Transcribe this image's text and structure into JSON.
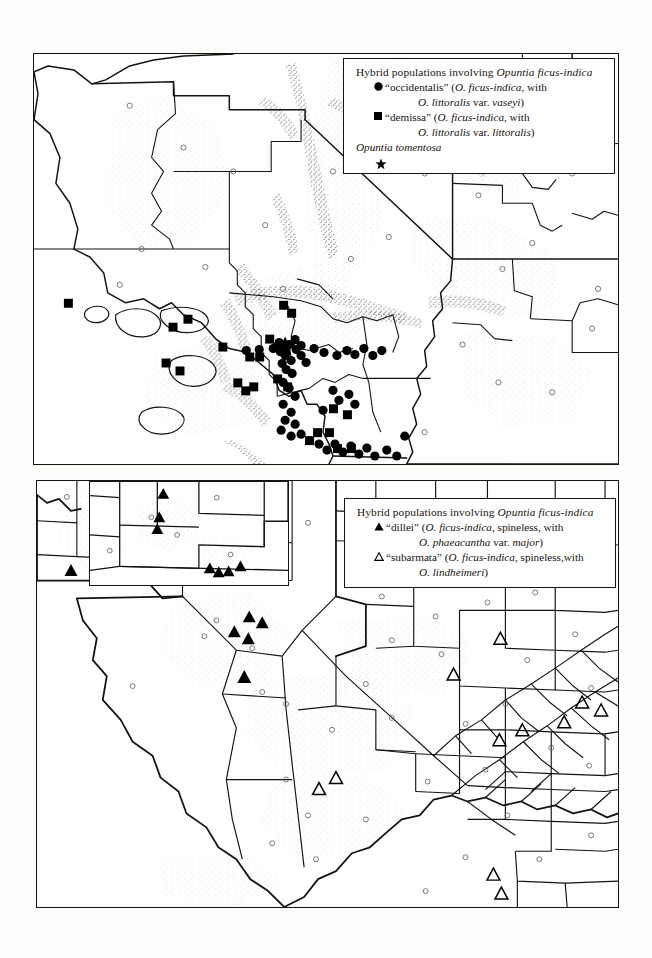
{
  "page": {
    "background_color": "#fdfdfc",
    "ink_color": "#15130f"
  },
  "figure": {
    "type": "distribution-maps",
    "panels": [
      {
        "id": "top",
        "region": "California, Nevada, Arizona, Utah",
        "legend_id": "legend-top"
      },
      {
        "id": "bottom",
        "region": "New Mexico and Texas",
        "legend_id": "legend-bottom",
        "inset_label": "New Mexico inset"
      }
    ]
  },
  "legend_top": {
    "title_plain": "Hybrid populations involving ",
    "title_italic": "Opuntia ficus-indica",
    "entries": [
      {
        "symbol": "filled-circle",
        "line1_pre": "“occiden­talis” (",
        "line1_label": "“occidentalis” (",
        "line1_italic": "O. ficus-indica",
        "line1_post": ", with",
        "line2_italic_a": "O. littoralis",
        "line2_mid": " var. ",
        "line2_italic_b": "vaseyi",
        "line2_post": ")"
      },
      {
        "symbol": "filled-square",
        "line1_label": "“demissa” (",
        "line1_italic": "O. ficus-indica",
        "line1_post": ", with",
        "line2_italic_a": "O. littoralis",
        "line2_mid": " var. ",
        "line2_italic_b": "littoralis",
        "line2_post": ")"
      }
    ],
    "tomentosa_label": "Opuntia tomentosa",
    "tomentosa_symbol": "filled-star"
  },
  "legend_bottom": {
    "title_plain": "Hybrid populations involving ",
    "title_italic": "Opuntia ficus-indica",
    "entries": [
      {
        "symbol": "filled-triangle",
        "line1_label": "“dillei” (",
        "line1_italic": "O. ficus-indica",
        "line1_post": ", spineless, with",
        "line2_italic_a": "O. phaeacantha",
        "line2_mid": " var. ",
        "line2_italic_b": "major",
        "line2_post": ")"
      },
      {
        "symbol": "open-triangle",
        "line1_label": "“subarmata” (",
        "line1_italic": "O. ficus-indica",
        "line1_post": ", spineless,with",
        "line2_italic_a": "O. lindheimeri",
        "line2_mid": "",
        "line2_italic_b": "",
        "line2_post": ")"
      }
    ]
  },
  "map_data": {
    "top_panel": {
      "filled_circles_count": 48,
      "filled_squares_count": 24,
      "stars_count": 1,
      "note": "dense clusters in coastal and southern California"
    },
    "bottom_panel": {
      "filled_triangles_count": 14,
      "open_triangles_count": 11,
      "note": "filled triangles in New Mexico inset and west Texas; open triangles in south and central Texas"
    }
  }
}
